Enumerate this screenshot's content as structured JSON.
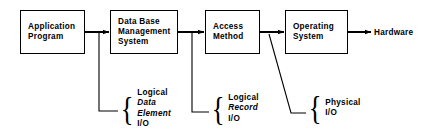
{
  "diagram": {
    "background_color": "#ffffff",
    "stroke_color": "#000000",
    "nodes": [
      {
        "id": "application-program",
        "lines": [
          "Application",
          "Program"
        ],
        "x": 20,
        "y": 10,
        "width": 65,
        "height": 44
      },
      {
        "id": "data-base-management-system",
        "lines": [
          "Data Base",
          "Management",
          "System"
        ],
        "x": 110,
        "y": 10,
        "width": 68,
        "height": 44
      },
      {
        "id": "access-method",
        "lines": [
          "Access",
          "Method"
        ],
        "x": 205,
        "y": 10,
        "width": 55,
        "height": 44
      },
      {
        "id": "operating-system",
        "lines": [
          "Operating",
          "System"
        ],
        "x": 285,
        "y": 10,
        "width": 63,
        "height": 44
      }
    ],
    "terminal": {
      "id": "hardware",
      "label": "Hardware",
      "x": 374,
      "y": 28
    },
    "annotations": [
      {
        "id": "logical-data-element-io",
        "x": 119,
        "y": 88,
        "brace": "{",
        "lines": [
          {
            "text": "Logical",
            "italic": false
          },
          {
            "text": "Data",
            "italic": true
          },
          {
            "text": "Element",
            "italic": true
          },
          {
            "text": "I/O",
            "italic": false
          }
        ]
      },
      {
        "id": "logical-record-io",
        "x": 210,
        "y": 93,
        "brace": "{",
        "lines": [
          {
            "text": "Logical",
            "italic": false
          },
          {
            "text": "Record",
            "italic": true
          },
          {
            "text": "I/O",
            "italic": false
          }
        ]
      },
      {
        "id": "physical-io",
        "x": 307,
        "y": 98,
        "brace": "{",
        "lines": [
          {
            "text": "Physical",
            "italic": false
          },
          {
            "text": "I/O",
            "italic": false
          }
        ]
      }
    ]
  }
}
